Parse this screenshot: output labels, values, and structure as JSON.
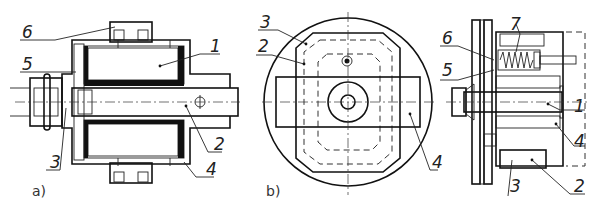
{
  "figure": {
    "views": [
      {
        "id": "a",
        "caption": "a)",
        "description": "Longitudinal section of electromagnet assembly",
        "labels": [
          {
            "num": "6",
            "x": 22,
            "y": 38
          },
          {
            "num": "1",
            "x": 210,
            "y": 52
          },
          {
            "num": "5",
            "x": 22,
            "y": 70
          },
          {
            "num": "2",
            "x": 214,
            "y": 150
          },
          {
            "num": "3",
            "x": 50,
            "y": 168
          },
          {
            "num": "4",
            "x": 206,
            "y": 175
          }
        ]
      },
      {
        "id": "b",
        "caption": "b)",
        "description": "End view",
        "labels": [
          {
            "num": "3",
            "x": 260,
            "y": 28
          },
          {
            "num": "2",
            "x": 258,
            "y": 52
          },
          {
            "num": "4",
            "x": 432,
            "y": 168
          }
        ]
      },
      {
        "id": "c",
        "caption": "",
        "description": "Section with spring-loaded armature",
        "labels": [
          {
            "num": "7",
            "x": 510,
            "y": 30
          },
          {
            "num": "6",
            "x": 442,
            "y": 44
          },
          {
            "num": "5",
            "x": 442,
            "y": 76
          },
          {
            "num": "1",
            "x": 574,
            "y": 112
          },
          {
            "num": "4",
            "x": 574,
            "y": 147
          },
          {
            "num": "3",
            "x": 510,
            "y": 192
          },
          {
            "num": "2",
            "x": 574,
            "y": 192
          }
        ]
      }
    ]
  }
}
